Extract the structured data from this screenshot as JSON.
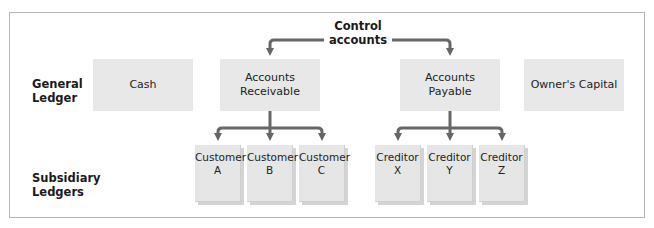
{
  "diagram": {
    "control_label": "Control accounts",
    "control_label_lines": [
      "Control",
      "accounts"
    ],
    "rows": {
      "general_ledger": {
        "label_lines": [
          "General",
          "Ledger"
        ]
      },
      "subsidiary_ledgers": {
        "label_lines": [
          "Subsidiary",
          "Ledgers"
        ]
      }
    },
    "general_ledger_accounts": [
      {
        "lines": [
          "Cash"
        ]
      },
      {
        "lines": [
          "Accounts",
          "Receivable"
        ]
      },
      {
        "lines": [
          "Accounts",
          "Payable"
        ]
      },
      {
        "lines": [
          "Owner's Capital"
        ]
      }
    ],
    "subsidiary_groups": [
      {
        "parent": "Accounts Receivable",
        "items": [
          {
            "lines": [
              "Customer",
              "A"
            ]
          },
          {
            "lines": [
              "Customer",
              "B"
            ]
          },
          {
            "lines": [
              "Customer",
              "C"
            ]
          }
        ]
      },
      {
        "parent": "Accounts Payable",
        "items": [
          {
            "lines": [
              "Creditor",
              "X"
            ]
          },
          {
            "lines": [
              "Creditor",
              "Y"
            ]
          },
          {
            "lines": [
              "Creditor",
              "Z"
            ]
          }
        ]
      }
    ],
    "colors": {
      "box_fill": "#e8e8e8",
      "arrow": "#666666",
      "frame_border": "#b5b5b5"
    }
  }
}
